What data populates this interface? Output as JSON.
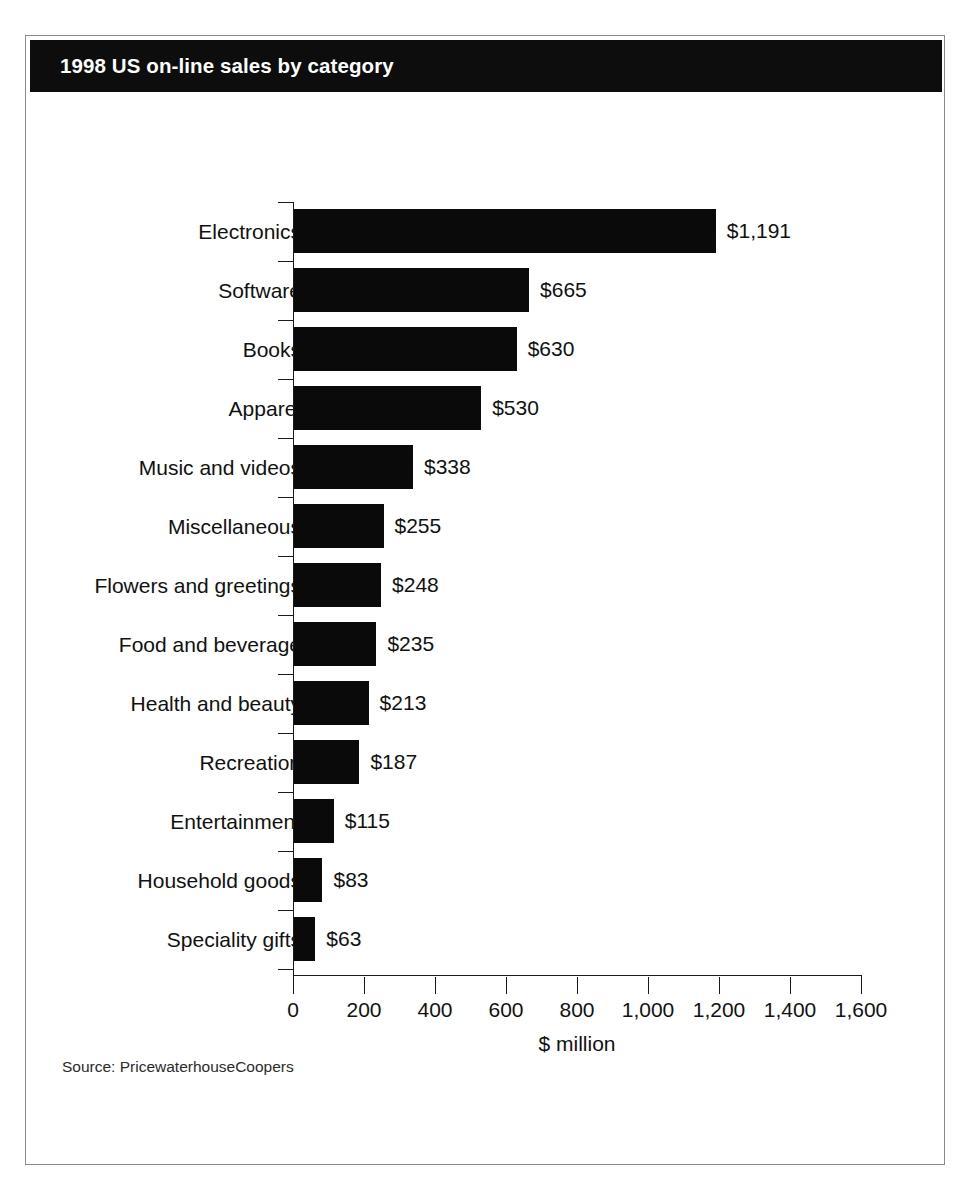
{
  "figure": {
    "title": "1998 US on-line sales by category",
    "source_note": "Source: PricewaterhouseCoopers",
    "title_band_color": "#0d0d0d",
    "title_text_color": "#ffffff",
    "bar_color": "#0a0a0a",
    "frame_color": "#8a8a8a",
    "background_color": "#ffffff"
  },
  "chart_data": {
    "type": "bar",
    "orientation": "horizontal",
    "title": "1998 US on-line sales by category",
    "subtitle": "",
    "xlabel": "$ million",
    "ylabel": "",
    "xlim": [
      0,
      1600
    ],
    "xticks": [
      0,
      200,
      400,
      600,
      800,
      1000,
      1200,
      1400,
      1600
    ],
    "xtick_labels": [
      "0",
      "200",
      "400",
      "600",
      "800",
      "1,000",
      "1,200",
      "1,400",
      "1,600"
    ],
    "grid": false,
    "legend": false,
    "units": "$ million",
    "sorted": "descending",
    "categories": [
      "Electronics",
      "Software",
      "Books",
      "Apparel",
      "Music and videos",
      "Miscellaneous",
      "Flowers and greetings",
      "Food and beverage",
      "Health and beauty",
      "Recreation",
      "Entertainment",
      "Household goods",
      "Speciality gifts"
    ],
    "values": [
      1191,
      665,
      630,
      530,
      338,
      255,
      248,
      235,
      213,
      187,
      115,
      83,
      63
    ],
    "data_labels": [
      "$1,191",
      "$665",
      "$630",
      "$530",
      "$338",
      "$255",
      "$248",
      "$235",
      "$213",
      "$187",
      "$115",
      "$83",
      "$63"
    ]
  }
}
